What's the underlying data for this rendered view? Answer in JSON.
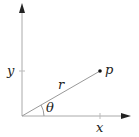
{
  "diagram": {
    "labels": {
      "x_axis": "x",
      "y_axis": "y",
      "radius": "r",
      "angle": "θ",
      "point": "p"
    },
    "colors": {
      "axis": "#222222",
      "ray": "#999999",
      "tick": "#bbbbbb",
      "point": "#111111"
    }
  }
}
